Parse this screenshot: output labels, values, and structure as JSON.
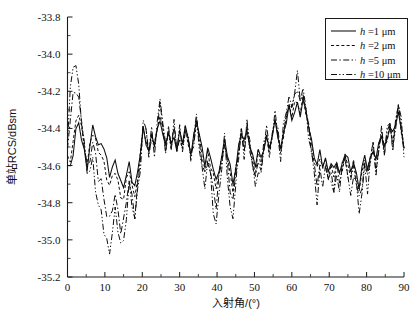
{
  "figure": {
    "title": "",
    "background": "#ffffff",
    "ink_color": "#0d0d0d"
  },
  "axes": {
    "x_label": "入射角/(°)",
    "y_label": "单站RCS/dBsm",
    "x_ticklabels": [
      "0",
      "10",
      "20",
      "30",
      "40",
      "50",
      "60",
      "70",
      "80",
      "90"
    ],
    "y_ticklabels": [
      "-33.8",
      "-34.0",
      "-34.2",
      "-34.4",
      "-34.6",
      "-34.8",
      "-35.0",
      "-35.2"
    ]
  },
  "legend": {
    "position": "top-right",
    "items": [
      {
        "label_prefix": "h",
        "label_rest": " =1 μm",
        "style": "solid"
      },
      {
        "label_prefix": "h",
        "label_rest": " =2 μm",
        "style": "dotted"
      },
      {
        "label_prefix": "h",
        "label_rest": " =5 μm",
        "style": "dash-dot"
      },
      {
        "label_prefix": "h",
        "label_rest": " =10 μm",
        "style": "dash-dot-dot"
      }
    ]
  },
  "chart_data": {
    "type": "line",
    "title": "",
    "xlabel": "入射角/(°)",
    "ylabel": "单站RCS/dBsm",
    "xlim": [
      0,
      90
    ],
    "ylim": [
      -35.2,
      -33.8
    ],
    "xticks": [
      0,
      10,
      20,
      30,
      40,
      50,
      60,
      70,
      80,
      90
    ],
    "yticks": [
      -35.2,
      -35.0,
      -34.8,
      -34.6,
      -34.4,
      -34.2,
      -34.0,
      -33.8
    ],
    "grid": false,
    "legend_position": "upper right",
    "x": [
      0,
      0.75,
      1.5,
      2.25,
      3,
      3.75,
      4.5,
      5.25,
      6,
      6.75,
      7.5,
      8.25,
      9,
      9.75,
      10.5,
      11.25,
      12,
      12.75,
      13.5,
      14.25,
      15,
      15.75,
      16.5,
      17.25,
      18,
      18.75,
      19.5,
      20.25,
      21,
      21.75,
      22.5,
      23.25,
      24,
      24.75,
      25.5,
      26.25,
      27,
      27.75,
      28.5,
      29.25,
      30,
      30.75,
      31.5,
      32.25,
      33,
      33.75,
      34.5,
      35.25,
      36,
      36.75,
      37.5,
      38.25,
      39,
      39.75,
      40.5,
      41.25,
      42,
      42.75,
      43.5,
      44.25,
      45,
      45.75,
      46.5,
      47.25,
      48,
      48.75,
      49.5,
      50.25,
      51,
      51.75,
      52.5,
      53.25,
      54,
      54.75,
      55.5,
      56.25,
      57,
      57.75,
      58.5,
      59.25,
      60,
      60.75,
      61.5,
      62.25,
      63,
      63.75,
      64.5,
      65.25,
      66,
      66.75,
      67.5,
      68.25,
      69,
      69.75,
      70.5,
      71.25,
      72,
      72.75,
      73.5,
      74.25,
      75,
      75.75,
      76.5,
      77.25,
      78,
      78.75,
      79.5,
      80.25,
      81,
      81.75,
      82.5,
      83.25,
      84,
      84.75,
      85.5,
      86.25,
      87,
      87.75,
      88.5,
      89.25,
      90
    ],
    "series": [
      {
        "name": "h =1 μm",
        "style": "solid",
        "values": [
          -34.6,
          -34.6,
          -34.52,
          -34.42,
          -34.38,
          -34.46,
          -34.52,
          -34.6,
          -34.5,
          -34.4,
          -34.44,
          -34.5,
          -34.46,
          -34.5,
          -34.58,
          -34.66,
          -34.62,
          -34.56,
          -34.62,
          -34.7,
          -34.72,
          -34.66,
          -34.58,
          -34.66,
          -34.72,
          -34.64,
          -34.54,
          -34.4,
          -34.46,
          -34.52,
          -34.44,
          -34.5,
          -34.42,
          -34.34,
          -34.42,
          -34.5,
          -34.42,
          -34.5,
          -34.44,
          -34.5,
          -34.42,
          -34.48,
          -34.4,
          -34.46,
          -34.52,
          -34.44,
          -34.36,
          -34.44,
          -34.52,
          -34.58,
          -34.5,
          -34.56,
          -34.62,
          -34.7,
          -34.62,
          -34.54,
          -34.46,
          -34.54,
          -34.62,
          -34.7,
          -34.6,
          -34.5,
          -34.42,
          -34.48,
          -34.42,
          -34.48,
          -34.54,
          -34.6,
          -34.52,
          -34.58,
          -34.5,
          -34.44,
          -34.5,
          -34.44,
          -34.38,
          -34.44,
          -34.5,
          -34.42,
          -34.36,
          -34.3,
          -34.36,
          -34.3,
          -34.26,
          -34.32,
          -34.26,
          -34.32,
          -34.38,
          -34.46,
          -34.54,
          -34.6,
          -34.54,
          -34.6,
          -34.56,
          -34.62,
          -34.58,
          -34.64,
          -34.58,
          -34.64,
          -34.58,
          -34.52,
          -34.58,
          -34.64,
          -34.58,
          -34.64,
          -34.7,
          -34.62,
          -34.56,
          -34.62,
          -34.56,
          -34.5,
          -34.56,
          -34.5,
          -34.44,
          -34.5,
          -34.44,
          -34.38,
          -34.44,
          -34.38,
          -34.32,
          -34.4,
          -34.48
        ]
      },
      {
        "name": "h =2 μm",
        "style": "dotted",
        "values": [
          -34.58,
          -34.56,
          -34.46,
          -34.36,
          -34.32,
          -34.42,
          -34.5,
          -34.58,
          -34.48,
          -34.42,
          -34.48,
          -34.54,
          -34.52,
          -34.58,
          -34.66,
          -34.72,
          -34.68,
          -34.62,
          -34.68,
          -34.76,
          -34.78,
          -34.7,
          -34.62,
          -34.7,
          -34.76,
          -34.66,
          -34.56,
          -34.4,
          -34.46,
          -34.52,
          -34.44,
          -34.5,
          -34.42,
          -34.32,
          -34.4,
          -34.5,
          -34.42,
          -34.5,
          -34.44,
          -34.52,
          -34.44,
          -34.5,
          -34.42,
          -34.48,
          -34.54,
          -34.46,
          -34.36,
          -34.46,
          -34.56,
          -34.62,
          -34.52,
          -34.58,
          -34.66,
          -34.74,
          -34.64,
          -34.56,
          -34.46,
          -34.56,
          -34.66,
          -34.74,
          -34.62,
          -34.52,
          -34.42,
          -34.5,
          -34.42,
          -34.5,
          -34.56,
          -34.62,
          -34.54,
          -34.6,
          -34.52,
          -34.44,
          -34.52,
          -34.44,
          -34.36,
          -34.44,
          -34.52,
          -34.42,
          -34.34,
          -34.28,
          -34.34,
          -34.28,
          -34.24,
          -34.3,
          -34.24,
          -34.32,
          -34.4,
          -34.48,
          -34.56,
          -34.62,
          -34.56,
          -34.62,
          -34.58,
          -34.64,
          -34.6,
          -34.66,
          -34.6,
          -34.66,
          -34.6,
          -34.54,
          -34.6,
          -34.66,
          -34.6,
          -34.66,
          -34.72,
          -34.64,
          -34.56,
          -34.64,
          -34.56,
          -34.5,
          -34.58,
          -34.5,
          -34.44,
          -34.52,
          -34.44,
          -34.38,
          -34.46,
          -34.38,
          -34.3,
          -34.4,
          -34.5
        ]
      },
      {
        "name": "h =5 μm",
        "style": "dash-dot",
        "values": [
          -34.52,
          -34.36,
          -34.22,
          -34.16,
          -34.24,
          -34.38,
          -34.5,
          -34.62,
          -34.54,
          -34.46,
          -34.56,
          -34.68,
          -34.7,
          -34.76,
          -34.84,
          -34.9,
          -34.84,
          -34.78,
          -34.84,
          -34.92,
          -34.9,
          -34.8,
          -34.7,
          -34.78,
          -34.84,
          -34.7,
          -34.58,
          -34.4,
          -34.44,
          -34.52,
          -34.42,
          -34.5,
          -34.4,
          -34.3,
          -34.38,
          -34.5,
          -34.4,
          -34.5,
          -34.42,
          -34.52,
          -34.42,
          -34.5,
          -34.4,
          -34.48,
          -34.56,
          -34.46,
          -34.34,
          -34.46,
          -34.6,
          -34.68,
          -34.56,
          -34.62,
          -34.72,
          -34.82,
          -34.7,
          -34.58,
          -34.46,
          -34.58,
          -34.72,
          -34.82,
          -34.66,
          -34.54,
          -34.4,
          -34.5,
          -34.4,
          -34.5,
          -34.58,
          -34.66,
          -34.56,
          -34.62,
          -34.52,
          -34.42,
          -34.52,
          -34.42,
          -34.34,
          -34.44,
          -34.54,
          -34.42,
          -34.32,
          -34.24,
          -34.32,
          -34.24,
          -34.18,
          -34.26,
          -34.18,
          -34.3,
          -34.42,
          -34.52,
          -34.6,
          -34.68,
          -34.58,
          -34.66,
          -34.6,
          -34.68,
          -34.62,
          -34.7,
          -34.62,
          -34.7,
          -34.62,
          -34.54,
          -34.62,
          -34.7,
          -34.62,
          -34.7,
          -34.78,
          -34.68,
          -34.58,
          -34.68,
          -34.58,
          -34.5,
          -34.6,
          -34.5,
          -34.42,
          -34.54,
          -34.44,
          -34.36,
          -34.48,
          -34.38,
          -34.28,
          -34.4,
          -34.52
        ]
      },
      {
        "name": "h =10 μm",
        "style": "dash-dot-dot",
        "values": [
          -34.46,
          -34.24,
          -34.06,
          -34.04,
          -34.16,
          -34.34,
          -34.52,
          -34.66,
          -34.6,
          -34.56,
          -34.7,
          -34.84,
          -34.88,
          -34.94,
          -35.0,
          -35.04,
          -34.96,
          -34.88,
          -34.94,
          -35.02,
          -34.98,
          -34.86,
          -34.74,
          -34.82,
          -34.88,
          -34.72,
          -34.58,
          -34.4,
          -34.42,
          -34.52,
          -34.4,
          -34.5,
          -34.38,
          -34.28,
          -34.36,
          -34.5,
          -34.38,
          -34.5,
          -34.4,
          -34.52,
          -34.4,
          -34.5,
          -34.38,
          -34.48,
          -34.58,
          -34.46,
          -34.32,
          -34.46,
          -34.64,
          -34.74,
          -34.58,
          -34.66,
          -34.8,
          -34.92,
          -34.78,
          -34.62,
          -34.46,
          -34.62,
          -34.8,
          -34.92,
          -34.7,
          -34.54,
          -34.38,
          -34.52,
          -34.38,
          -34.52,
          -34.62,
          -34.72,
          -34.58,
          -34.66,
          -34.52,
          -34.4,
          -34.54,
          -34.4,
          -34.3,
          -34.44,
          -34.58,
          -34.42,
          -34.28,
          -34.2,
          -34.3,
          -34.2,
          -34.14,
          -34.24,
          -34.14,
          -34.3,
          -34.44,
          -34.56,
          -34.66,
          -34.76,
          -34.62,
          -34.7,
          -34.62,
          -34.72,
          -34.64,
          -34.74,
          -34.64,
          -34.74,
          -34.64,
          -34.54,
          -34.64,
          -34.76,
          -34.64,
          -34.74,
          -34.86,
          -34.72,
          -34.6,
          -34.72,
          -34.6,
          -34.5,
          -34.62,
          -34.5,
          -34.4,
          -34.56,
          -34.44,
          -34.34,
          -34.5,
          -34.38,
          -34.26,
          -34.4,
          -34.54
        ]
      }
    ]
  }
}
